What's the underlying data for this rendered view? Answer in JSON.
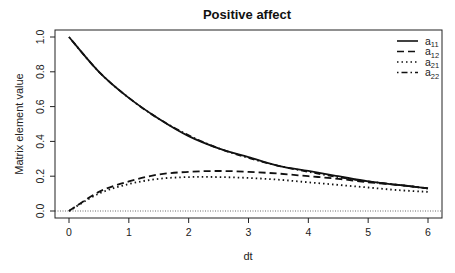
{
  "chart_data": {
    "type": "line",
    "title": "Positive affect",
    "xlabel": "dt",
    "ylabel": "Matrix element value",
    "xlim": [
      0,
      6
    ],
    "ylim": [
      0,
      1
    ],
    "x_ticks": [
      "0",
      "1",
      "2",
      "3",
      "4",
      "5",
      "6"
    ],
    "y_ticks": [
      "0.0",
      "0.2",
      "0.4",
      "0.6",
      "0.8",
      "1.0"
    ],
    "grid": false,
    "legend_position": "top-right",
    "reference_line": {
      "y": 0,
      "style": "dotted"
    },
    "x": [
      0,
      0.5,
      1,
      1.5,
      2,
      2.5,
      3,
      3.5,
      4,
      4.5,
      5,
      5.5,
      6
    ],
    "series": [
      {
        "name": "a11",
        "sub": "11",
        "style": "solid",
        "values": [
          1.0,
          0.8,
          0.65,
          0.53,
          0.43,
          0.36,
          0.31,
          0.26,
          0.23,
          0.2,
          0.17,
          0.15,
          0.13
        ]
      },
      {
        "name": "a12",
        "sub": "12",
        "style": "dashed",
        "values": [
          0.0,
          0.11,
          0.17,
          0.21,
          0.225,
          0.23,
          0.225,
          0.215,
          0.2,
          0.185,
          0.165,
          0.15,
          0.13
        ]
      },
      {
        "name": "a21",
        "sub": "21",
        "style": "dotted",
        "values": [
          0.0,
          0.1,
          0.155,
          0.185,
          0.195,
          0.195,
          0.19,
          0.18,
          0.165,
          0.15,
          0.135,
          0.12,
          0.11
        ]
      },
      {
        "name": "a22",
        "sub": "22",
        "style": "dashdot",
        "values": [
          1.0,
          0.8,
          0.65,
          0.53,
          0.435,
          0.36,
          0.305,
          0.26,
          0.225,
          0.195,
          0.17,
          0.15,
          0.13
        ]
      }
    ]
  }
}
